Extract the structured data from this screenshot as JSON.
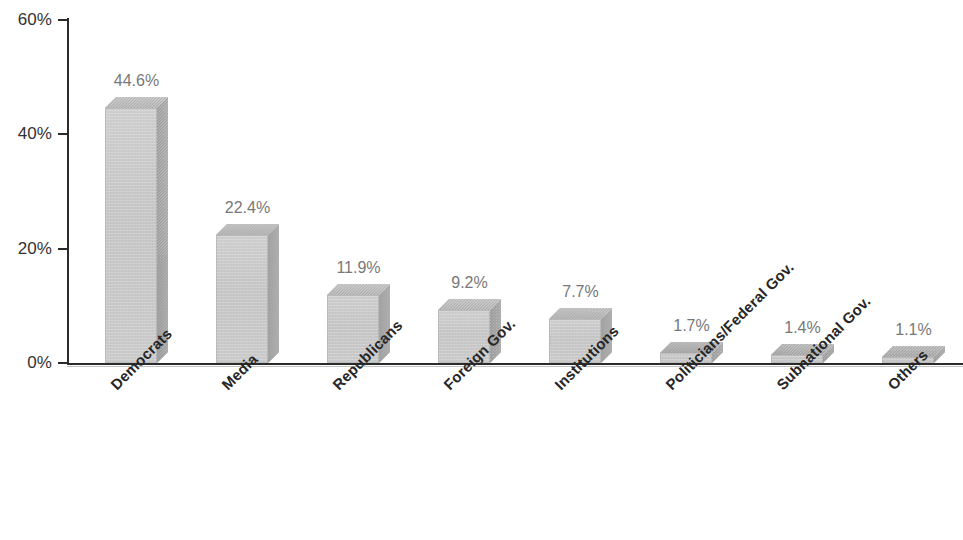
{
  "chart_data": {
    "type": "bar",
    "title": "",
    "subtitle": "",
    "xlabel": "",
    "ylabel": "",
    "ylim": [
      0,
      60
    ],
    "y_ticks": [
      "0%",
      "20%",
      "40%",
      "60%"
    ],
    "y_tick_values": [
      0,
      20,
      40,
      60
    ],
    "grid": false,
    "legend": "none",
    "orientation": "vertical",
    "style_3d": true,
    "value_suffix": "%",
    "categories": [
      "Democrats",
      "Media",
      "Republicans",
      "Foreign Gov.",
      "Institutions",
      "Politicians/Federal Gov.",
      "Subnational Gov.",
      "Others"
    ],
    "values": [
      44.6,
      22.4,
      11.9,
      9.2,
      7.7,
      1.7,
      1.4,
      1.1
    ],
    "data_labels": [
      "44.6%",
      "22.4%",
      "11.9%",
      "9.2%",
      "7.7%",
      "1.7%",
      "1.4%",
      "1.1%"
    ],
    "colors": {
      "bar_front": "#cfcfcf",
      "bar_side": "#a8a8a8",
      "bar_top": "#bdbdbd",
      "axis": "#2b2b2b",
      "tick_label": "#333132",
      "data_label": "#787878",
      "category_label": "#262626",
      "background": "#ffffff"
    }
  }
}
